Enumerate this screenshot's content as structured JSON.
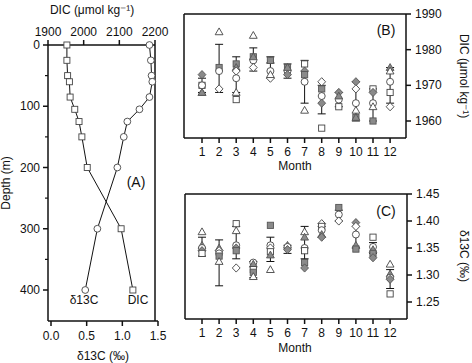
{
  "chart_data": [
    {
      "panel": "A",
      "type": "line",
      "label": "(A)",
      "ylabel": "Depth (m)",
      "ylim": [
        0,
        400
      ],
      "yticks": [
        0,
        100,
        200,
        300,
        400
      ],
      "top_xlabel": "DIC (μmol kg⁻¹)",
      "top_xlim": [
        1900,
        2200
      ],
      "top_xticks": [
        1900,
        2000,
        2100,
        2200
      ],
      "bottom_xlabel": "δ13C (‰)",
      "bottom_xlim": [
        0.0,
        1.5
      ],
      "bottom_xticks": [
        "0.0",
        "0.5",
        "1.0",
        "1.5"
      ],
      "series": [
        {
          "name": "DIC",
          "marker": "square-open",
          "axis": "top",
          "depth": [
            0,
            25,
            50,
            60,
            85,
            105,
            125,
            150,
            200,
            300,
            400
          ],
          "values": [
            1953,
            1953,
            1955,
            1960,
            1962,
            1975,
            1987,
            1995,
            2010,
            2105,
            2138
          ]
        },
        {
          "name": "δ13C",
          "marker": "circle-open",
          "axis": "bottom",
          "depth": [
            0,
            25,
            50,
            60,
            85,
            105,
            125,
            150,
            200,
            300,
            400
          ],
          "values": [
            1.38,
            1.4,
            1.41,
            1.42,
            1.38,
            1.24,
            1.07,
            1.02,
            0.93,
            0.65,
            0.48
          ]
        }
      ],
      "annotations": [
        "δ13C",
        "DIC"
      ]
    },
    {
      "panel": "B",
      "type": "scatter",
      "label": "(B)",
      "xlabel": "Month",
      "ylabel": "DIC (μmol kg⁻¹)",
      "ylim": [
        1958,
        1990
      ],
      "yticks": [
        1960,
        1970,
        1980,
        1990
      ],
      "categories": [
        1,
        2,
        3,
        4,
        5,
        6,
        7,
        8,
        9,
        10,
        11,
        12
      ],
      "mean": [
        1970,
        1974.5,
        1973,
        1977,
        1975,
        1974,
        1970.5,
        1966,
        1965,
        1966,
        1965,
        1970
      ],
      "error": [
        [
          1968,
          1972
        ],
        [
          1968,
          1981.5
        ],
        [
          1968,
          1978
        ],
        [
          1974,
          1980.5
        ],
        [
          1972,
          1978
        ],
        [
          1972,
          1976
        ],
        [
          1965,
          1977
        ],
        [
          1962,
          1970
        ],
        [
          1964,
          1968
        ],
        [
          1960,
          1971
        ],
        [
          1960,
          1969
        ],
        [
          1965,
          1975
        ]
      ],
      "points": [
        [
          [
            "diamond-filled",
            1973
          ],
          [
            "square-open",
            1970
          ],
          [
            "circle-open",
            1970
          ],
          [
            "triangle-open",
            1968
          ],
          [
            "triangle-filled",
            1968
          ]
        ],
        [
          [
            "triangle-open",
            1985
          ],
          [
            "square-filled",
            1975
          ],
          [
            "circle-open",
            1974
          ],
          [
            "diamond-open",
            1969
          ]
        ],
        [
          [
            "square-filled",
            1976
          ],
          [
            "triangle-filled",
            1975
          ],
          [
            "diamond-open",
            1974
          ],
          [
            "circle-open",
            1972
          ],
          [
            "triangle-open",
            1968
          ],
          [
            "square-open",
            1966
          ]
        ],
        [
          [
            "triangle-open",
            1984
          ],
          [
            "square-filled",
            1978
          ],
          [
            "circle-open",
            1977
          ],
          [
            "diamond-open",
            1975
          ],
          [
            "triangle-filled",
            1978
          ]
        ],
        [
          [
            "triangle-filled",
            1977
          ],
          [
            "square-filled",
            1977
          ],
          [
            "circle-open",
            1974
          ],
          [
            "diamond-open",
            1972
          ],
          [
            "triangle-open",
            1973
          ]
        ],
        [
          [
            "square-filled",
            1975
          ],
          [
            "circle-open",
            1974
          ],
          [
            "diamond-filled",
            1973
          ],
          [
            "triangle-filled",
            1975
          ]
        ],
        [
          [
            "square-open",
            1976
          ],
          [
            "diamond-filled",
            1974
          ],
          [
            "circle-open",
            1971
          ],
          [
            "square-filled",
            1973
          ],
          [
            "triangle-open",
            1963
          ]
        ],
        [
          [
            "diamond-open",
            1971
          ],
          [
            "square-filled",
            1969
          ],
          [
            "circle-open",
            1967
          ],
          [
            "diamond-filled",
            1965
          ],
          [
            "square-open",
            1958
          ]
        ],
        [
          [
            "diamond-filled",
            1968
          ],
          [
            "circle-open",
            1966
          ],
          [
            "square-open",
            1964
          ],
          [
            "triangle-filled",
            1967
          ]
        ],
        [
          [
            "diamond-filled",
            1971
          ],
          [
            "diamond-open",
            1969
          ],
          [
            "circle-open",
            1965
          ],
          [
            "triangle-open",
            1963
          ],
          [
            "square-filled",
            1961
          ],
          [
            "triangle-filled",
            1961
          ]
        ],
        [
          [
            "square-open",
            1969
          ],
          [
            "diamond-filled",
            1968
          ],
          [
            "circle-open",
            1965
          ],
          [
            "triangle-open",
            1964
          ],
          [
            "square-filled",
            1960
          ]
        ],
        [
          [
            "triangle-filled",
            1975
          ],
          [
            "triangle-open",
            1974
          ],
          [
            "circle-open",
            1971
          ],
          [
            "square-open",
            1968
          ],
          [
            "diamond-open",
            1964
          ]
        ]
      ]
    },
    {
      "panel": "C",
      "type": "scatter",
      "label": "(C)",
      "xlabel": "Month",
      "ylabel": "δ13C (‰)",
      "ylim": [
        1.25,
        1.45
      ],
      "yticks": [
        "1.25",
        "1.30",
        "1.35",
        "1.40",
        "1.45"
      ],
      "categories": [
        1,
        2,
        3,
        4,
        5,
        6,
        7,
        8,
        9,
        10,
        11,
        12
      ],
      "mean": [
        1.35,
        1.34,
        1.35,
        1.31,
        1.35,
        1.35,
        1.35,
        1.38,
        1.41,
        1.37,
        1.35,
        1.29
      ],
      "error": [
        [
          1.335,
          1.37
        ],
        [
          1.28,
          1.365
        ],
        [
          1.33,
          1.39
        ],
        [
          1.295,
          1.325
        ],
        [
          1.325,
          1.37
        ],
        [
          1.34,
          1.355
        ],
        [
          1.33,
          1.39
        ],
        [
          1.37,
          1.39
        ],
        [
          1.4,
          1.42
        ],
        [
          1.35,
          1.39
        ],
        [
          1.34,
          1.36
        ],
        [
          1.275,
          1.31
        ]
      ],
      "points": [
        [
          [
            "triangle-open",
            1.38
          ],
          [
            "triangle-filled",
            1.355
          ],
          [
            "circle-open",
            1.35
          ],
          [
            "diamond-filled",
            1.345
          ],
          [
            "square-open",
            1.34
          ]
        ],
        [
          [
            "triangle-filled",
            1.35
          ],
          [
            "diamond-open",
            1.345
          ],
          [
            "circle-open",
            1.34
          ],
          [
            "square-filled",
            1.335
          ],
          [
            "triangle-open",
            1.325
          ]
        ],
        [
          [
            "square-open",
            1.395
          ],
          [
            "triangle-open",
            1.382
          ],
          [
            "circle-open",
            1.355
          ],
          [
            "diamond-filled",
            1.35
          ],
          [
            "square-filled",
            1.345
          ],
          [
            "diamond-open",
            1.313
          ]
        ],
        [
          [
            "circle-open",
            1.323
          ],
          [
            "triangle-filled",
            1.32
          ],
          [
            "square-open",
            1.31
          ],
          [
            "square-filled",
            1.305
          ],
          [
            "triangle-open",
            1.297
          ]
        ],
        [
          [
            "square-filled",
            1.392
          ],
          [
            "circle-open",
            1.355
          ],
          [
            "diamond-open",
            1.35
          ],
          [
            "square-open",
            1.343
          ],
          [
            "triangle-filled",
            1.337
          ],
          [
            "triangle-open",
            1.31
          ]
        ],
        [
          [
            "triangle-filled",
            1.355
          ],
          [
            "circle-open",
            1.352
          ],
          [
            "diamond-filled",
            1.347
          ]
        ],
        [
          [
            "triangle-open",
            1.38
          ],
          [
            "triangle-filled",
            1.37
          ],
          [
            "circle-open",
            1.35
          ],
          [
            "square-open",
            1.345
          ],
          [
            "square-filled",
            1.323
          ],
          [
            "diamond-filled",
            1.313
          ]
        ],
        [
          [
            "diamond-open",
            1.395
          ],
          [
            "square-open",
            1.39
          ],
          [
            "circle-open",
            1.383
          ],
          [
            "triangle-filled",
            1.375
          ],
          [
            "diamond-filled",
            1.37
          ]
        ],
        [
          [
            "square-filled",
            1.425
          ],
          [
            "circle-open",
            1.412
          ],
          [
            "diamond-open",
            1.4
          ]
        ],
        [
          [
            "diamond-filled",
            1.397
          ],
          [
            "diamond-open",
            1.39
          ],
          [
            "circle-open",
            1.375
          ],
          [
            "triangle-filled",
            1.355
          ],
          [
            "square-filled",
            1.348
          ]
        ],
        [
          [
            "square-open",
            1.37
          ],
          [
            "circle-open",
            1.352
          ],
          [
            "triangle-filled",
            1.347
          ],
          [
            "square-filled",
            1.34
          ],
          [
            "diamond-filled",
            1.332
          ]
        ],
        [
          [
            "triangle-open",
            1.32
          ],
          [
            "triangle-filled",
            1.302
          ],
          [
            "circle-open",
            1.295
          ],
          [
            "diamond-filled",
            1.292
          ],
          [
            "square-open",
            1.265
          ]
        ]
      ]
    }
  ],
  "layout": {
    "panelA": {
      "left": 48,
      "right": 155,
      "top": 45,
      "bottom": 321,
      "depth_px_per_m": 0.6125
    },
    "panelB": {
      "left": 184,
      "right": 406,
      "top": 14,
      "bottom": 138,
      "x0": 202,
      "dx": 17.1
    },
    "panelC": {
      "left": 185,
      "right": 407,
      "top": 194,
      "bottom": 319,
      "x0": 202,
      "dx": 17.1
    },
    "colors": {
      "ink": "#111111",
      "fill": "#8a8a8a",
      "open": "#ffffff",
      "errorbar": "#333333"
    }
  }
}
